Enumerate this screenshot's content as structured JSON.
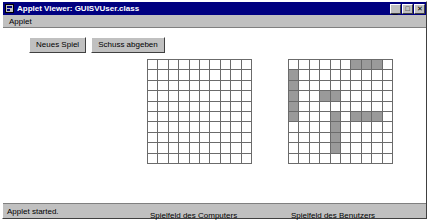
{
  "window": {
    "title": "Applet Viewer: GUISVUser.class",
    "icon": "applet-viewer-icon",
    "controls": [
      {
        "name": "minimize-button",
        "glyph": "_"
      },
      {
        "name": "maximize-button",
        "glyph": "□"
      },
      {
        "name": "close-button",
        "glyph": "✕"
      }
    ]
  },
  "menu": {
    "items": [
      {
        "label": "Applet"
      }
    ]
  },
  "toolbar": {
    "new_game_label": "Neues Spiel",
    "fire_shot_label": "Schuss abgeben"
  },
  "boards": {
    "computer": {
      "caption": "Spielfeld des Computers",
      "rows": 10,
      "cols": 10,
      "ship_cells": []
    },
    "user": {
      "caption": "Spielfeld des Benutzers",
      "rows": 10,
      "cols": 10,
      "ship_cells": [
        [
          0,
          6
        ],
        [
          0,
          7
        ],
        [
          0,
          8
        ],
        [
          1,
          0
        ],
        [
          2,
          0
        ],
        [
          3,
          0
        ],
        [
          3,
          3
        ],
        [
          3,
          4
        ],
        [
          4,
          0
        ],
        [
          5,
          0
        ],
        [
          5,
          4
        ],
        [
          5,
          6
        ],
        [
          5,
          7
        ],
        [
          5,
          8
        ],
        [
          6,
          4
        ],
        [
          7,
          4
        ],
        [
          8,
          4
        ]
      ]
    }
  },
  "status": {
    "text": "Applet started."
  },
  "colors": {
    "title_bar": "#000080",
    "window_face": "#c0c0c0",
    "grid_line": "#6b6b6b",
    "ship_fill": "#9a9a9a",
    "canvas": "#ffffff"
  }
}
